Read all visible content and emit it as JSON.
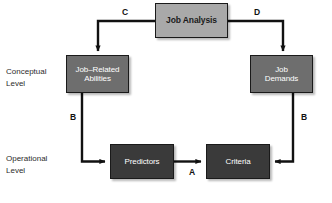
{
  "diagram": {
    "nodes": [
      {
        "id": "job-analysis",
        "label_lines": [
          "Job Analysis"
        ],
        "style": "light",
        "fill": "#a9a9a9",
        "text_color": "#1b1b1b",
        "x": 155,
        "y": 3,
        "w": 73,
        "h": 35
      },
      {
        "id": "job-related-abilities",
        "label_lines": [
          "Job–Related",
          "Abilities"
        ],
        "style": "mid",
        "fill": "#6e6e6e",
        "text_color": "#ffffff",
        "x": 66,
        "y": 55,
        "w": 63,
        "h": 38
      },
      {
        "id": "job-demands",
        "label_lines": [
          "Job",
          "Demands"
        ],
        "style": "mid",
        "fill": "#6e6e6e",
        "text_color": "#ffffff",
        "x": 250,
        "y": 55,
        "w": 63,
        "h": 38
      },
      {
        "id": "predictors",
        "label_lines": [
          "Predictors"
        ],
        "style": "dark",
        "fill": "#3a3a3a",
        "text_color": "#ffffff",
        "x": 110,
        "y": 144,
        "w": 64,
        "h": 35
      },
      {
        "id": "criteria",
        "label_lines": [
          "Criteria"
        ],
        "style": "dark",
        "fill": "#3a3a3a",
        "text_color": "#ffffff",
        "x": 206,
        "y": 144,
        "w": 64,
        "h": 35
      }
    ],
    "level_labels": [
      {
        "id": "conceptual-level",
        "lines": [
          "Conceptual",
          "Level"
        ],
        "x": 6,
        "y": 66
      },
      {
        "id": "operational-level",
        "lines": [
          "Operational",
          "Level"
        ],
        "x": 6,
        "y": 153
      }
    ],
    "edge_labels": [
      {
        "id": "edge-label-c",
        "text": "C",
        "x": 122,
        "y": 8
      },
      {
        "id": "edge-label-d",
        "text": "D",
        "x": 254,
        "y": 8
      },
      {
        "id": "edge-label-b-left",
        "text": "B",
        "x": 70,
        "y": 113
      },
      {
        "id": "edge-label-b-right",
        "text": "B",
        "x": 301,
        "y": 113
      },
      {
        "id": "edge-label-a",
        "text": "A",
        "x": 189,
        "y": 168
      }
    ],
    "edges": [
      {
        "id": "edge-job-analysis-to-abilities",
        "label": "C",
        "from": "job-analysis",
        "to": "job-related-abilities"
      },
      {
        "id": "edge-job-analysis-to-demands",
        "label": "D",
        "from": "job-analysis",
        "to": "job-demands"
      },
      {
        "id": "edge-abilities-to-predictors",
        "label": "B",
        "from": "job-related-abilities",
        "to": "predictors"
      },
      {
        "id": "edge-demands-to-criteria",
        "label": "B",
        "from": "job-demands",
        "to": "criteria"
      },
      {
        "id": "edge-predictors-to-criteria",
        "label": "A",
        "from": "predictors",
        "to": "criteria"
      }
    ],
    "colors": {
      "background": "#ffffff",
      "stroke": "#111111",
      "node_light": "#a9a9a9",
      "node_mid": "#6e6e6e",
      "node_dark": "#3a3a3a"
    }
  }
}
